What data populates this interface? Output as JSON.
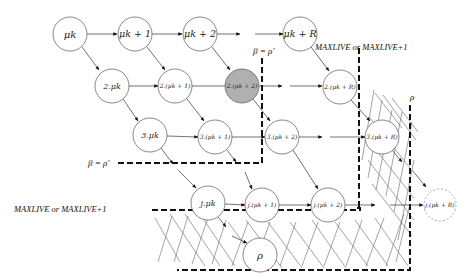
{
  "diagram": {
    "nodes": [
      {
        "id": "n11",
        "label": "μk",
        "cx": 70,
        "cy": 34,
        "r": 17,
        "size": 10
      },
      {
        "id": "n12",
        "label": "μk + 1",
        "cx": 135,
        "cy": 34,
        "r": 17,
        "size": 9.5
      },
      {
        "id": "n13",
        "label": "μk + 2",
        "cx": 200,
        "cy": 34,
        "r": 17,
        "size": 9.5
      },
      {
        "id": "n1R",
        "label": "μk + R",
        "cx": 300,
        "cy": 34,
        "r": 17,
        "size": 9.5
      },
      {
        "id": "n21",
        "label": "2.μk",
        "cx": 112,
        "cy": 86,
        "r": 17,
        "size": 8
      },
      {
        "id": "n22",
        "label": "2.(μk + 1)",
        "cx": 175,
        "cy": 86,
        "r": 17,
        "size": 6
      },
      {
        "id": "n23",
        "label": "2.(μk + 2)",
        "cx": 242,
        "cy": 86,
        "r": 17,
        "size": 6,
        "fill": "#b0b0b0"
      },
      {
        "id": "n2R",
        "label": "2.(μk + R)",
        "cx": 340,
        "cy": 87,
        "r": 17,
        "size": 6
      },
      {
        "id": "n31",
        "label": "3.μk",
        "cx": 150,
        "cy": 135,
        "r": 17,
        "size": 8
      },
      {
        "id": "n32",
        "label": "3.(μk + 1)",
        "cx": 215,
        "cy": 137,
        "r": 17,
        "size": 6
      },
      {
        "id": "n33",
        "label": "3.(μk + 2)",
        "cx": 282,
        "cy": 137,
        "r": 17,
        "size": 6
      },
      {
        "id": "n3R",
        "label": "3.(μk + R)",
        "cx": 382,
        "cy": 137,
        "r": 17,
        "size": 6
      },
      {
        "id": "nj1",
        "label": "j.μk",
        "cx": 208,
        "cy": 203,
        "r": 17,
        "size": 8
      },
      {
        "id": "nj2",
        "label": "j.(μk + 1)",
        "cx": 262,
        "cy": 205,
        "r": 17,
        "size": 6
      },
      {
        "id": "nj3",
        "label": "j.(μk + 2)",
        "cx": 328,
        "cy": 205,
        "r": 17,
        "size": 6
      },
      {
        "id": "njR",
        "label": "j.(μk + R)",
        "cx": 440,
        "cy": 205,
        "r": 16,
        "size": 6,
        "dashed": true
      },
      {
        "id": "rho",
        "label": "ρ",
        "cx": 260,
        "cy": 255,
        "r": 17,
        "size": 10
      }
    ],
    "labels": {
      "beta_top": "β = ρ'",
      "beta_left": "β = ρ'",
      "maxlive_top": "MAXLIVE or MAXLIVE+1",
      "maxlive_left": "MAXLIVE or MAXLIVE+1",
      "rho_right": "ρ"
    },
    "colors": {
      "stroke": "#444444",
      "highlight": "#b0b0b0",
      "dashed": "#111111",
      "hatch": "#555555"
    }
  }
}
